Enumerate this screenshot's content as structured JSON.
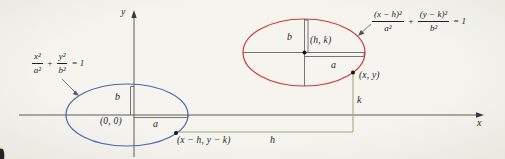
{
  "figure": {
    "background": "#f1f0ea",
    "colors": {
      "axis": "#4b4b4b",
      "ellipse_standard": "#4a69ad",
      "ellipse_translated": "#cb3a40",
      "offset_lines": "#9aa878",
      "text": "#1f1f1f"
    },
    "axes": {
      "x_label": "x",
      "y_label": "y"
    },
    "standard_ellipse": {
      "equation": {
        "num1": "x²",
        "den1": "a²",
        "plus": "+",
        "num2": "y²",
        "den2": "b²",
        "rhs": "= 1"
      },
      "center_label": "(0, 0)",
      "semi_major_label": "a",
      "semi_minor_label": "b",
      "point_label": "(x − h, y − k)"
    },
    "translated_ellipse": {
      "equation": {
        "num1": "(x − h)²",
        "den1": "a²",
        "plus": "+",
        "num2": "(y − k)²",
        "den2": "b²",
        "rhs": "= 1"
      },
      "center_label": "(h, k)",
      "semi_major_label": "a",
      "semi_minor_label": "b",
      "point_label": "(x, y)"
    },
    "offsets": {
      "horizontal_label": "h",
      "vertical_label": "k"
    }
  }
}
